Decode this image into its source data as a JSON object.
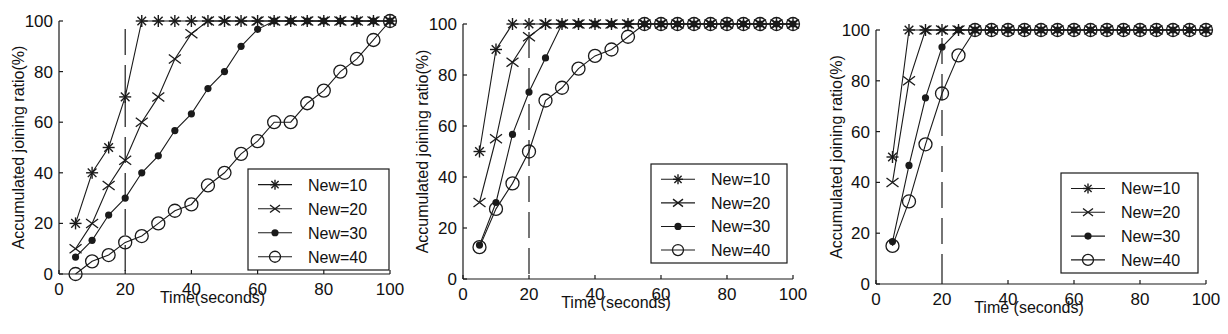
{
  "figure": {
    "panel_count": 3,
    "legend_labels": [
      "New=10",
      "New=20",
      "New=30",
      "New=40"
    ],
    "marker_styles": [
      "asterisk",
      "x",
      "filled-circle",
      "open-circle"
    ],
    "line_color": "#1a1a1a"
  },
  "chart_data": [
    {
      "type": "line",
      "title": "",
      "xlabel": "Time(seconds)",
      "ylabel": "Accumulated joining ratio(%)",
      "xlim": [
        0,
        100
      ],
      "ylim": [
        0,
        100
      ],
      "xticks": [
        0,
        20,
        40,
        60,
        80,
        100
      ],
      "yticks": [
        0,
        20,
        40,
        60,
        80,
        100
      ],
      "grid": false,
      "legend_position": "lower right",
      "vline": {
        "x": 20,
        "style": "dashed"
      },
      "x": [
        5,
        10,
        15,
        20,
        25,
        30,
        35,
        40,
        45,
        50,
        55,
        60,
        65,
        70,
        75,
        80,
        85,
        90,
        95,
        100
      ],
      "series": [
        {
          "name": "New=10",
          "marker": "asterisk",
          "values": [
            20,
            40,
            50,
            70,
            100,
            100,
            100,
            100,
            100,
            100,
            100,
            100,
            100,
            100,
            100,
            100,
            100,
            100,
            100,
            100
          ]
        },
        {
          "name": "New=20",
          "marker": "x",
          "values": [
            10,
            20,
            35,
            45,
            60,
            70,
            85,
            95,
            100,
            100,
            100,
            100,
            100,
            100,
            100,
            100,
            100,
            100,
            100,
            100
          ]
        },
        {
          "name": "New=30",
          "marker": "filled-circle",
          "values": [
            6.7,
            13.3,
            23.3,
            30,
            40,
            46.7,
            56.7,
            63.3,
            73.3,
            80,
            90,
            96.7,
            100,
            100,
            100,
            100,
            100,
            100,
            100,
            100
          ]
        },
        {
          "name": "New=40",
          "marker": "open-circle",
          "values": [
            0,
            5,
            7.5,
            12.5,
            15,
            20,
            25,
            27.5,
            35,
            40,
            47.5,
            52.5,
            60,
            60,
            67.5,
            72.5,
            80,
            85,
            92.5,
            100
          ]
        }
      ]
    },
    {
      "type": "line",
      "title": "",
      "xlabel": "Time (seconds)",
      "ylabel": "Accumulated joining ratio(%)",
      "xlim": [
        0,
        100
      ],
      "ylim": [
        0,
        100
      ],
      "xticks": [
        0,
        20,
        40,
        60,
        80,
        100
      ],
      "yticks": [
        0,
        20,
        40,
        60,
        80,
        100
      ],
      "grid": false,
      "legend_position": "lower right",
      "vline": {
        "x": 20,
        "style": "dashed"
      },
      "x": [
        5,
        10,
        15,
        20,
        25,
        30,
        35,
        40,
        45,
        50,
        55,
        60,
        65,
        70,
        75,
        80,
        85,
        90,
        95,
        100
      ],
      "series": [
        {
          "name": "New=10",
          "marker": "asterisk",
          "values": [
            50,
            90,
            100,
            100,
            100,
            100,
            100,
            100,
            100,
            100,
            100,
            100,
            100,
            100,
            100,
            100,
            100,
            100,
            100,
            100
          ]
        },
        {
          "name": "New=20",
          "marker": "x",
          "values": [
            30,
            55,
            85,
            95,
            100,
            100,
            100,
            100,
            100,
            100,
            100,
            100,
            100,
            100,
            100,
            100,
            100,
            100,
            100,
            100
          ]
        },
        {
          "name": "New=30",
          "marker": "filled-circle",
          "values": [
            13.3,
            30,
            56.7,
            73.3,
            86.7,
            100,
            100,
            100,
            100,
            100,
            100,
            100,
            100,
            100,
            100,
            100,
            100,
            100,
            100,
            100
          ]
        },
        {
          "name": "New=40",
          "marker": "open-circle",
          "values": [
            12.5,
            27.5,
            37.5,
            50,
            70,
            75,
            82.5,
            87.5,
            90,
            95,
            100,
            100,
            100,
            100,
            100,
            100,
            100,
            100,
            100,
            100
          ]
        }
      ]
    },
    {
      "type": "line",
      "title": "",
      "xlabel": "Time (seconds)",
      "ylabel": "Accumulated joining ratio(%)",
      "xlim": [
        0,
        100
      ],
      "ylim": [
        0,
        100
      ],
      "xticks": [
        0,
        20,
        40,
        60,
        80,
        100
      ],
      "yticks": [
        0,
        20,
        40,
        60,
        80,
        100
      ],
      "grid": false,
      "legend_position": "lower right",
      "vline": {
        "x": 20,
        "style": "dashed"
      },
      "x": [
        5,
        10,
        15,
        20,
        25,
        30,
        35,
        40,
        45,
        50,
        55,
        60,
        65,
        70,
        75,
        80,
        85,
        90,
        95,
        100
      ],
      "series": [
        {
          "name": "New=10",
          "marker": "asterisk",
          "values": [
            50,
            100,
            100,
            100,
            100,
            100,
            100,
            100,
            100,
            100,
            100,
            100,
            100,
            100,
            100,
            100,
            100,
            100,
            100,
            100
          ]
        },
        {
          "name": "New=20",
          "marker": "x",
          "values": [
            40,
            80,
            100,
            100,
            100,
            100,
            100,
            100,
            100,
            100,
            100,
            100,
            100,
            100,
            100,
            100,
            100,
            100,
            100,
            100
          ]
        },
        {
          "name": "New=30",
          "marker": "filled-circle",
          "values": [
            16.7,
            46.7,
            73.3,
            93.3,
            100,
            100,
            100,
            100,
            100,
            100,
            100,
            100,
            100,
            100,
            100,
            100,
            100,
            100,
            100,
            100
          ]
        },
        {
          "name": "New=40",
          "marker": "open-circle",
          "values": [
            15,
            32.5,
            55,
            75,
            90,
            100,
            100,
            100,
            100,
            100,
            100,
            100,
            100,
            100,
            100,
            100,
            100,
            100,
            100,
            100
          ]
        }
      ]
    }
  ]
}
